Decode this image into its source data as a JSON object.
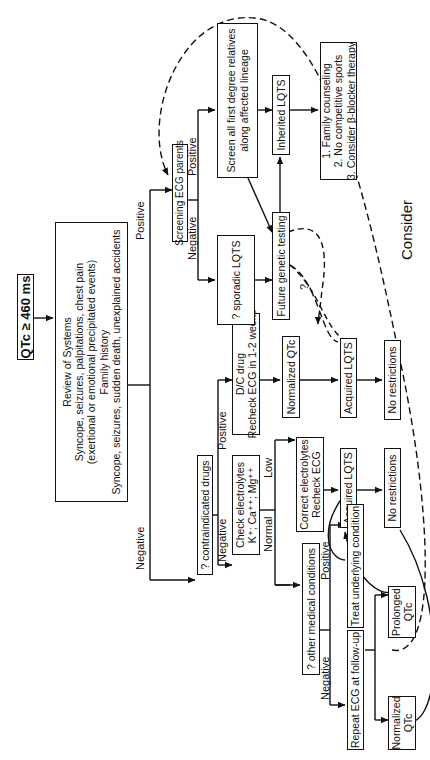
{
  "diagram": {
    "orientation": "rotated-90-ccw",
    "nodes": {
      "start": {
        "lines": [
          "QTc ≥ 460 ms"
        ]
      },
      "review": {
        "lines": [
          "Review of Systems",
          "Syncope, seizures, palpitations, chest pain",
          "(exertional or emotional precipitated events)",
          "Family history",
          "Syncope, seizures, sudden death, unexplained accidents"
        ]
      },
      "contraindicated": {
        "lines": [
          "? contraindicated drugs"
        ]
      },
      "screening_parents": {
        "lines": [
          "Screening ECG parents"
        ]
      },
      "dc_drug": {
        "lines": [
          "D/C drug",
          "Recheck ECG in 1-2 weeks"
        ]
      },
      "check_electrolytes": {
        "lines": [
          "Check electrolytes",
          "K⁺; Ca⁺⁺; Mg⁺⁺"
        ]
      },
      "sporadic": {
        "lines": [
          "? sporadic LQTS"
        ]
      },
      "screen_relatives": {
        "lines": [
          "Screen all first degree relatives",
          "along affected lineage"
        ]
      },
      "normalized_qtc_a": {
        "lines": [
          "Normalized QTc"
        ]
      },
      "correct_electrolytes": {
        "lines": [
          "Correct electrolytes",
          "Recheck ECG"
        ]
      },
      "other_conditions": {
        "lines": [
          "? other medical conditions"
        ]
      },
      "future_genetic": {
        "lines": [
          "Future genetic testing"
        ]
      },
      "inherited": {
        "lines": [
          "Inherited LQTS"
        ]
      },
      "acquired_a": {
        "lines": [
          "Acquired LQTS"
        ]
      },
      "acquired_b": {
        "lines": [
          "Acquired LQTS"
        ]
      },
      "treat_underlying": {
        "lines": [
          "Treat underlying condition"
        ]
      },
      "repeat_ecg": {
        "lines": [
          "Repeat ECG at follow-up"
        ]
      },
      "no_restrictions_a": {
        "lines": [
          "No restrictions"
        ]
      },
      "no_restrictions_b": {
        "lines": [
          "No restrictions"
        ]
      },
      "prolonged_qtc": {
        "lines": [
          "Prolonged",
          "QTc"
        ]
      },
      "normalized_qtc_b": {
        "lines": [
          "Normalized",
          "QTc"
        ]
      },
      "management": {
        "lines": [
          "1. Family counseling",
          "2. No competitive sports",
          "3. Consider β-blocker therapy"
        ]
      }
    },
    "edge_labels": {
      "review_negative": "Negative",
      "review_positive": "Positive",
      "drugs_negative": "Negative",
      "drugs_positive": "Positive",
      "parents_negative": "Negative",
      "parents_positive": "Positive",
      "electrolytes_normal": "Normal",
      "electrolytes_low": "Low",
      "conditions_negative": "Negative",
      "conditions_positive": "Positive",
      "genetic_question": "?",
      "consider": "Consider"
    },
    "colors": {
      "line": "#111111",
      "background": "#ffffff"
    }
  }
}
